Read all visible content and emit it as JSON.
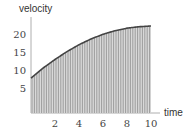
{
  "chart_data": {
    "type": "area",
    "title": "",
    "xlabel": "time",
    "ylabel": "velocity",
    "xlim": [
      0,
      10
    ],
    "ylim": [
      0,
      23
    ],
    "x_ticks": [
      "2",
      "4",
      "6",
      "8",
      "10"
    ],
    "y_ticks": [
      "5",
      "10",
      "15",
      "20"
    ],
    "grid": false,
    "legend": null,
    "fill": "vertical hatch lines under curve",
    "x": [
      0,
      1,
      2,
      3,
      4,
      5,
      6,
      7,
      8,
      9,
      10
    ],
    "series": [
      {
        "name": "velocity",
        "values": [
          8.0,
          10.8,
          13.2,
          15.4,
          17.3,
          18.9,
          20.2,
          21.2,
          21.9,
          22.3,
          22.5
        ]
      }
    ]
  },
  "colors": {
    "curve": "#444444",
    "hatch": "#8c8c8c",
    "fill": "#d9d9d9",
    "axis": "#888888"
  }
}
